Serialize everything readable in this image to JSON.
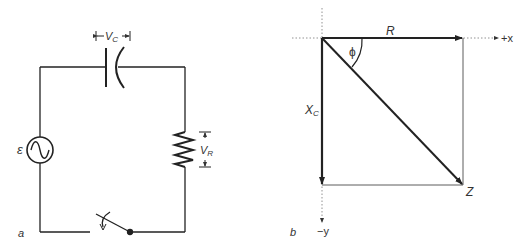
{
  "panel_a": {
    "label": "a",
    "emf_symbol": "ε",
    "capacitor_voltage": {
      "main": "V",
      "sub": "C"
    },
    "resistor_voltage": {
      "main": "V",
      "sub": "R"
    }
  },
  "panel_b": {
    "label": "b",
    "r_label": "R",
    "phi_label": "ϕ",
    "xc_label": {
      "main": "X",
      "sub": "C"
    },
    "z_label": "Z",
    "x_axis_label": "+x",
    "y_axis_label": "−y"
  }
}
